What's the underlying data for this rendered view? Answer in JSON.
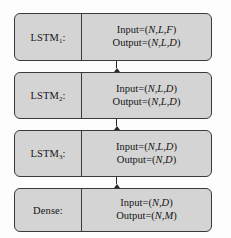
{
  "diagram": {
    "colors": {
      "box_fill": "#d4d4d4",
      "box_border": "#3a3a3a",
      "background": "#fdfdfd",
      "text": "#151515",
      "arrow": "#2a2a2a"
    },
    "layers": [
      {
        "name": "LSTM",
        "subscript": "1",
        "label_suffix": ":",
        "input": "Input=(N,L,F)",
        "output": "Output=(N,L,D)",
        "input_prefix": "Input=(",
        "input_vars": "N,L,F",
        "input_suffix": ")",
        "output_prefix": "Output=(",
        "output_vars": "N,L,D",
        "output_suffix": ")"
      },
      {
        "name": "LSTM",
        "subscript": "2",
        "label_suffix": ":",
        "input": "Input=(N,L,D)",
        "output": "Output=(N,L,D)",
        "input_prefix": "Input=(",
        "input_vars": "N,L,D",
        "input_suffix": ")",
        "output_prefix": "Output=(",
        "output_vars": "N,L,D",
        "output_suffix": ")"
      },
      {
        "name": "LSTM",
        "subscript": "3",
        "label_suffix": ":",
        "input": "Input=(N,L,D)",
        "output": "Output=(N,D)",
        "input_prefix": "Input=(",
        "input_vars": "N,L,D",
        "input_suffix": ")",
        "output_prefix": "Output=(",
        "output_vars": "N,D",
        "output_suffix": ")"
      },
      {
        "name": "Dense",
        "subscript": "",
        "label_suffix": ":",
        "input": "Input=(N,D)",
        "output": "Output=(N,M)",
        "input_prefix": "Input=(",
        "input_vars": "N,D",
        "input_suffix": ")",
        "output_prefix": "Output=(",
        "output_vars": "N,M",
        "output_suffix": ")"
      }
    ],
    "connectors": [
      {
        "from": "LSTM1",
        "to": "LSTM2",
        "direction": "down"
      },
      {
        "from": "LSTM2",
        "to": "LSTM3",
        "direction": "down"
      },
      {
        "from": "LSTM3",
        "to": "Dense",
        "direction": "down"
      }
    ]
  }
}
